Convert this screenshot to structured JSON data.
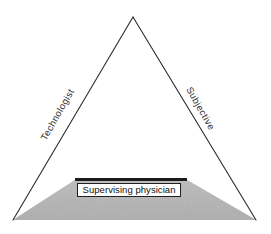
{
  "figure": {
    "type": "triangle-diagram",
    "background_color": "#ffffff",
    "stroke_color": "#2b2b2b",
    "base_fill_color": "#b9b9b9",
    "apex": {
      "x": 133,
      "y": 17
    },
    "bottom_left": {
      "x": 13,
      "y": 220
    },
    "bottom_right": {
      "x": 256,
      "y": 220
    }
  },
  "labels": {
    "left_edge": "Technologist",
    "right_edge": "Subjective",
    "base_caption": "Supervising physician"
  },
  "base": {
    "bar_color": "#1b1b1b",
    "box_border_color": "#1f1f1f",
    "box_fill_color": "#ffffff"
  }
}
